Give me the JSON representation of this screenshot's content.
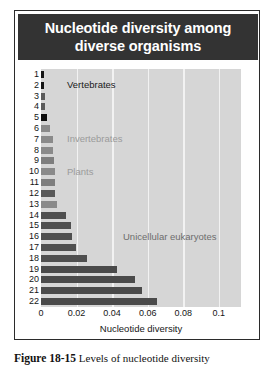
{
  "figure": {
    "number_label": "Figure 18-15",
    "caption_text": "Levels of nucleotide diversity"
  },
  "chart": {
    "title": "Nucleotide diversity among diverse organisms",
    "title_bg_color": "#333333",
    "title_text_color": "#ffffff",
    "panel_bg_color": "#d6d6d6",
    "gridline_color": "#f2f2f2"
  },
  "chart_data": {
    "type": "bar",
    "orientation": "horizontal",
    "title": "Nucleotide diversity among diverse organisms",
    "xlabel": "Nucleotide diversity",
    "ylabel": "",
    "xlim": [
      0,
      0.1125
    ],
    "xticks": [
      0,
      0.02,
      0.04,
      0.06,
      0.08,
      0.1
    ],
    "xticklabels": [
      "0",
      "0.02",
      "0.04",
      "0.06",
      "0.08",
      "0.1"
    ],
    "grid": "vertical",
    "legend": "none",
    "categories": [
      "1",
      "2",
      "3",
      "4",
      "5",
      "6",
      "7",
      "8",
      "9",
      "10",
      "11",
      "12",
      "13",
      "14",
      "15",
      "16",
      "17",
      "18",
      "19",
      "20",
      "21",
      "22"
    ],
    "values": [
      0.0013,
      0.0015,
      0.0022,
      0.0024,
      0.0035,
      0.0052,
      0.0066,
      0.0068,
      0.0075,
      0.0076,
      0.0078,
      0.0081,
      0.009,
      0.014,
      0.0168,
      0.0172,
      0.0196,
      0.026,
      0.043,
      0.053,
      0.057,
      0.0655
    ],
    "bar_colors": [
      "#151515",
      "#151515",
      "#5a5a5a",
      "#5a5a5a",
      "#0d0d0d",
      "#8a8a8a",
      "#8a8a8a",
      "#8a8a8a",
      "#7e7e7e",
      "#8a8a8a",
      "#7e7e7e",
      "#595959",
      "#8a8a8a",
      "#4f4f4f",
      "#4f4f4f",
      "#4f4f4f",
      "#4f4f4f",
      "#4f4f4f",
      "#4a4a4a",
      "#4a4a4a",
      "#4a4a4a",
      "#4a4a4a"
    ],
    "annotations": [
      {
        "text": "Vertebrates",
        "color": "#1a1a1a",
        "bar_index": 1
      },
      {
        "text": "Invertebrates",
        "color": "#9b9b9b",
        "bar_index": 6
      },
      {
        "text": "Plants",
        "color": "#9b9b9b",
        "bar_index": 9
      },
      {
        "text": "Unicellular eukaryotes",
        "color": "#6d6d6d",
        "bar_index": 15
      }
    ]
  }
}
